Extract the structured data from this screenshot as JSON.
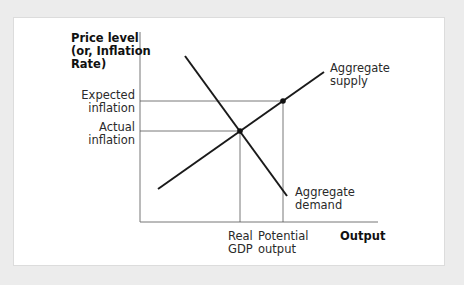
{
  "labels": {
    "y_axis_line1": "Price level",
    "y_axis_line2": "(or, Inflation",
    "y_axis_line3": "Rate)",
    "expected_line1": "Expected",
    "expected_line2": "inflation",
    "actual_line1": "Actual",
    "actual_line2": "inflation",
    "as_line1": "Aggregate",
    "as_line2": "supply",
    "ad_line1": "Aggregate",
    "ad_line2": "demand",
    "real_line1": "Real",
    "real_line2": "GDP",
    "potential_line1": "Potential",
    "potential_line2": "output",
    "x_axis": "Output"
  },
  "colors": {
    "line": "#1a1a1a",
    "guide": "#555555",
    "background": "#ececec",
    "panel": "#ffffff"
  }
}
